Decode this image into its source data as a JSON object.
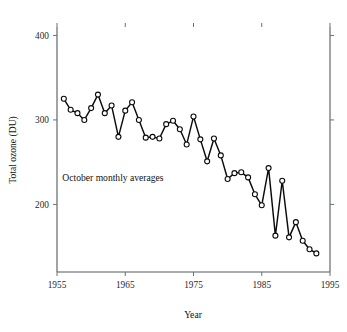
{
  "figure": {
    "background_color": "#ffffff",
    "foreground_color": "#0b0b0b",
    "axis_color": "#555a5e"
  },
  "chart_data": {
    "type": "line",
    "title": "",
    "subtitle": "",
    "xlabel": "Year",
    "ylabel": "Total ozone (DU)",
    "xlim": [
      1955,
      1995
    ],
    "ylim": [
      120,
      410
    ],
    "xticks": [
      1955,
      1965,
      1975,
      1985,
      1995
    ],
    "xtick_labels": [
      "1955",
      "1965",
      "1975",
      "1985",
      "1995"
    ],
    "yticks": [
      200,
      300,
      400
    ],
    "ytick_labels": [
      "200",
      "300",
      "400"
    ],
    "grid": false,
    "legend": null,
    "legend_position": "none",
    "annotations": [
      {
        "text": "October monthly averages",
        "x": 1963.2,
        "y": 228
      }
    ],
    "marker": "open-circle",
    "marker_face_color": "#ffffff",
    "marker_edge_color": "#0b0b0b",
    "line_color": "#0b0b0b",
    "series": [
      {
        "name": "Total ozone (October monthly average)",
        "x": [
          1956,
          1957,
          1958,
          1959,
          1960,
          1961,
          1962,
          1963,
          1964,
          1965,
          1966,
          1967,
          1968,
          1969,
          1970,
          1971,
          1972,
          1973,
          1974,
          1975,
          1976,
          1977,
          1978,
          1979,
          1980,
          1981,
          1982,
          1983,
          1984,
          1985,
          1986,
          1987,
          1988,
          1989,
          1990,
          1991,
          1992,
          1993
        ],
        "values": [
          325,
          312,
          308,
          300,
          314,
          330,
          308,
          317,
          280,
          311,
          321,
          300,
          279,
          280,
          278,
          295,
          299,
          289,
          271,
          304,
          277,
          251,
          278,
          258,
          230,
          237,
          238,
          232,
          212,
          199,
          243,
          163,
          228,
          161,
          179,
          157,
          147,
          142
        ]
      }
    ]
  },
  "axes_geometry": {
    "plot_left_px": 57,
    "plot_right_px": 330,
    "plot_top_px": 27,
    "plot_bottom_px": 272
  }
}
